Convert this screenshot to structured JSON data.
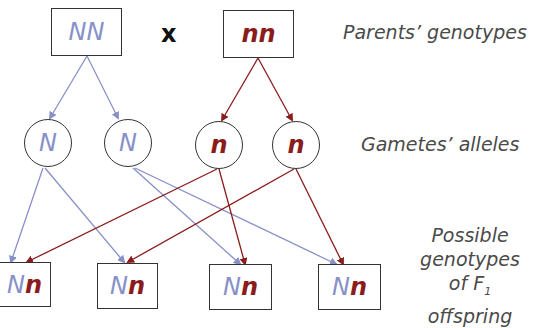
{
  "colors": {
    "dominant": "#8890c8",
    "recessive": "#8b1c1c",
    "outline": "#333333"
  },
  "parents": [
    {
      "genotype": "NN",
      "type": "dominant"
    },
    {
      "genotype": "nn",
      "type": "recessive"
    }
  ],
  "cross_symbol": "x",
  "gametes": [
    {
      "allele": "N",
      "type": "dominant"
    },
    {
      "allele": "N",
      "type": "dominant"
    },
    {
      "allele": "n",
      "type": "recessive"
    },
    {
      "allele": "n",
      "type": "recessive"
    }
  ],
  "offspring": [
    {
      "dom": "N",
      "rec": "n"
    },
    {
      "dom": "N",
      "rec": "n"
    },
    {
      "dom": "N",
      "rec": "n"
    },
    {
      "dom": "N",
      "rec": "n"
    }
  ],
  "labels": {
    "parents": "Parents’ genotypes",
    "gametes": "Gametes’ alleles",
    "offspring_line1": "Possible",
    "offspring_line2": "genotypes",
    "offspring_line3_prefix": "of F",
    "offspring_line3_sub": "1",
    "offspring_line3_suffix": " offspring"
  }
}
